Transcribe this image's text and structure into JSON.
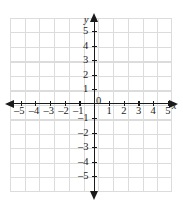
{
  "figure": {
    "type": "cartesian-coordinate-plane",
    "title": "",
    "background_color": "#ffffff",
    "grid_color": "#dcdcdc",
    "axis_color": "#1a1a1a"
  },
  "axes": {
    "x_name": "x",
    "y_name": "y",
    "origin_label": "0",
    "x_min": -5,
    "x_max": 5,
    "y_min": -5,
    "y_max": 5,
    "x_tick_labels_negative": [
      "–5",
      "–4",
      "–3",
      "–2",
      "–1"
    ],
    "x_tick_labels_positive": [
      "1",
      "2",
      "3",
      "4",
      "5"
    ],
    "y_tick_labels_positive": [
      "5",
      "4",
      "3",
      "2",
      "1"
    ],
    "y_tick_labels_negative": [
      "–1",
      "–2",
      "–3",
      "–4",
      "–5"
    ]
  },
  "chart_data": {
    "type": "scatter",
    "title": "",
    "xlabel": "x",
    "ylabel": "y",
    "xlim": [
      -5.7,
      5.7
    ],
    "ylim": [
      -5.9,
      5.9
    ],
    "grid": true,
    "legend": null,
    "x_ticks": [
      -5,
      -4,
      -3,
      -2,
      -1,
      1,
      2,
      3,
      4,
      5
    ],
    "y_ticks": [
      -5,
      -4,
      -3,
      -2,
      -1,
      1,
      2,
      3,
      4,
      5
    ],
    "x_tick_labels": [
      "–5",
      "–4",
      "–3",
      "–2",
      "–1",
      "1",
      "2",
      "3",
      "4",
      "5"
    ],
    "y_tick_labels": [
      "–5",
      "–4",
      "–3",
      "–2",
      "–1",
      "1",
      "2",
      "3",
      "4",
      "5"
    ],
    "series": [],
    "annotations": []
  }
}
